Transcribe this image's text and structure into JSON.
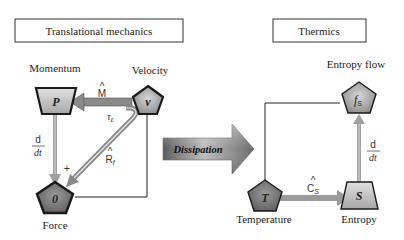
{
  "left_panel": {
    "title": "Translational mechanics",
    "nodes": {
      "momentum": {
        "label": "Momentum",
        "symbol": "P",
        "shape": "trapezoid"
      },
      "velocity": {
        "label": "Velocity",
        "symbol": "v",
        "shape": "pentagon"
      },
      "force": {
        "label": "Force",
        "symbol": "0",
        "shape": "pentagon"
      }
    },
    "edges": {
      "m_hat": "M",
      "tau": "τ",
      "tau_sub": "L",
      "r_hat": "R",
      "r_sub": "f",
      "d": "d",
      "dt": "dt",
      "plus": "+"
    }
  },
  "center": {
    "arrow_label": "Dissipation"
  },
  "right_panel": {
    "title": "Thermics",
    "nodes": {
      "entropy_flow": {
        "label": "Entropy flow",
        "symbol": "f",
        "sub": "S",
        "shape": "pentagon"
      },
      "temperature": {
        "label": "Temperature",
        "symbol": "T",
        "shape": "pentagon"
      },
      "entropy": {
        "label": "Entropy",
        "symbol": "S",
        "shape": "trapezoid"
      }
    },
    "edges": {
      "c_hat": "C",
      "c_sub": "S",
      "d": "d",
      "dt": "dt"
    }
  },
  "colors": {
    "node_light": "#c9c9c9",
    "node_dark": "#7a7a7a",
    "arrow_gray": "#8c8c8c",
    "outline": "#1a1a1a"
  }
}
